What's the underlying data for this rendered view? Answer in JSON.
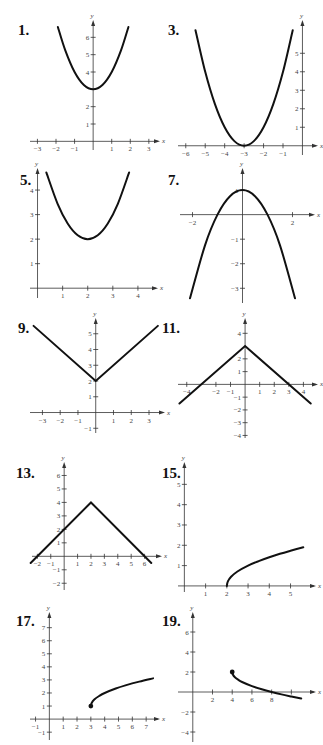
{
  "colors": {
    "curve": "#111111",
    "axis": "#333333",
    "tick_text": "#444444",
    "background": "#ffffff"
  },
  "chart_data": [
    {
      "id": "1",
      "label": "1.",
      "type": "line",
      "curve": "parabola",
      "equation_estimate": "y = x^2 + 3",
      "x_ticks": [
        -3,
        -2,
        -1,
        1,
        2,
        3
      ],
      "y_ticks": [
        1,
        2,
        4,
        5,
        6
      ],
      "xlim": [
        -3.4,
        3.6
      ],
      "ylim": [
        -0.5,
        7
      ],
      "xlabel": "x",
      "ylabel": "y",
      "points": [
        [
          -1.9,
          6.6
        ],
        [
          -1.5,
          5.25
        ],
        [
          -1,
          4
        ],
        [
          -0.5,
          3.25
        ],
        [
          0,
          3
        ],
        [
          0.5,
          3.25
        ],
        [
          1,
          4
        ],
        [
          1.5,
          5.25
        ],
        [
          1.9,
          6.6
        ]
      ],
      "box": {
        "left": 30,
        "top": 20,
        "width": 130,
        "height": 130
      },
      "num_pos": [
        18,
        22
      ]
    },
    {
      "id": "3",
      "label": "3.",
      "type": "line",
      "curve": "parabola",
      "equation_estimate": "y = (x + 3)^2",
      "x_ticks": [
        -6,
        -5,
        -4,
        -3,
        -2,
        -1
      ],
      "y_ticks": [
        1,
        2,
        3,
        4,
        5
      ],
      "xlim": [
        -6.4,
        0.8
      ],
      "ylim": [
        -0.5,
        6.8
      ],
      "xlabel": "x",
      "ylabel": "y",
      "points": [
        [
          -5.5,
          6.25
        ],
        [
          -5,
          4
        ],
        [
          -4.5,
          2.25
        ],
        [
          -4,
          1
        ],
        [
          -3.5,
          0.25
        ],
        [
          -3,
          0
        ],
        [
          -2.5,
          0.25
        ],
        [
          -2,
          1
        ],
        [
          -1.5,
          2.25
        ],
        [
          -1,
          4
        ],
        [
          -0.5,
          6.25
        ]
      ],
      "box": {
        "left": 178,
        "top": 20,
        "width": 140,
        "height": 135
      },
      "num_pos": [
        168,
        22
      ]
    },
    {
      "id": "5",
      "label": "5.",
      "type": "line",
      "curve": "parabola",
      "equation_estimate": "y = (x - 2)^2 + 2",
      "x_ticks": [
        1,
        2,
        3,
        4
      ],
      "y_ticks": [
        1,
        2,
        3,
        4
      ],
      "xlim": [
        -0.3,
        4.8
      ],
      "ylim": [
        -0.4,
        4.9
      ],
      "xlabel": "x",
      "ylabel": "y",
      "points": [
        [
          0.35,
          4.72
        ],
        [
          0.8,
          3.44
        ],
        [
          1.2,
          2.64
        ],
        [
          1.6,
          2.16
        ],
        [
          2,
          2
        ],
        [
          2.4,
          2.16
        ],
        [
          2.8,
          2.64
        ],
        [
          3.2,
          3.44
        ],
        [
          3.65,
          4.72
        ]
      ],
      "box": {
        "left": 30,
        "top": 168,
        "width": 128,
        "height": 130
      },
      "num_pos": [
        20,
        172
      ]
    },
    {
      "id": "7",
      "label": "7.",
      "type": "line",
      "curve": "parabola",
      "equation_estimate": "y = 1 - x^2",
      "x_ticks": [
        -2,
        2
      ],
      "y_ticks": [
        -3,
        -2,
        -1,
        1
      ],
      "xlim": [
        -2.5,
        2.9
      ],
      "ylim": [
        -3.6,
        1.9
      ],
      "xlabel": "x",
      "ylabel": "y",
      "points": [
        [
          -2.1,
          -3.41
        ],
        [
          -1.5,
          -1.25
        ],
        [
          -1,
          0
        ],
        [
          -0.5,
          0.75
        ],
        [
          0,
          1
        ],
        [
          0.5,
          0.75
        ],
        [
          1,
          0
        ],
        [
          1.5,
          -1.25
        ],
        [
          2.1,
          -3.41
        ]
      ],
      "box": {
        "left": 180,
        "top": 168,
        "width": 135,
        "height": 135
      },
      "num_pos": [
        168,
        172
      ]
    },
    {
      "id": "9",
      "label": "9.",
      "type": "line",
      "curve": "absolute-value",
      "equation_estimate": "y = |x| + 2",
      "x_ticks": [
        -3,
        -2,
        -1,
        1,
        2,
        3
      ],
      "y_ticks": [
        -1,
        1,
        2,
        3,
        4,
        5
      ],
      "xlim": [
        -3.7,
        3.9
      ],
      "ylim": [
        -1.3,
        6
      ],
      "xlabel": "x",
      "ylabel": "y",
      "points": [
        [
          -3.5,
          5.5
        ],
        [
          0,
          2
        ],
        [
          3.5,
          5.5
        ]
      ],
      "box": {
        "left": 30,
        "top": 318,
        "width": 135,
        "height": 115
      },
      "num_pos": [
        18,
        320
      ]
    },
    {
      "id": "11",
      "label": "11.",
      "type": "line",
      "curve": "absolute-value",
      "equation_estimate": "y = 3 - |x|",
      "x_ticks": [
        -4,
        -2,
        -1,
        1,
        2,
        3,
        4
      ],
      "y_ticks": [
        -4,
        -3,
        -2,
        -1,
        1,
        2,
        4
      ],
      "xlim": [
        -4.6,
        5.0
      ],
      "ylim": [
        -4.2,
        5.2
      ],
      "xlabel": "x",
      "ylabel": "y",
      "points": [
        [
          -4.5,
          -1.5
        ],
        [
          0,
          3
        ],
        [
          4.5,
          -1.5
        ]
      ],
      "box": {
        "left": 178,
        "top": 318,
        "width": 140,
        "height": 120
      },
      "num_pos": [
        162,
        320
      ]
    },
    {
      "id": "13",
      "label": "13.",
      "type": "line",
      "curve": "absolute-value",
      "equation_estimate": "y = 4 - |x - 2|",
      "x_ticks": [
        -2,
        -1,
        1,
        2,
        3,
        4,
        5,
        6
      ],
      "y_ticks": [
        -2,
        -1,
        1,
        2,
        3,
        4,
        5,
        6
      ],
      "xlim": [
        -2.4,
        7.3
      ],
      "ylim": [
        -2.5,
        7
      ],
      "xlabel": "x",
      "ylabel": "y",
      "points": [
        [
          -2.5,
          -0.5
        ],
        [
          2,
          4
        ],
        [
          6.5,
          -0.5
        ]
      ],
      "box": {
        "left": 32,
        "top": 462,
        "width": 130,
        "height": 128
      },
      "num_pos": [
        16,
        465
      ]
    },
    {
      "id": "15",
      "label": "15.",
      "type": "line",
      "curve": "square-root",
      "equation_estimate": "y = sqrt(x - 2)",
      "x_ticks": [
        1,
        2,
        3,
        4,
        5
      ],
      "y_ticks": [
        1,
        2,
        3,
        4,
        5
      ],
      "xlim": [
        -0.3,
        6.2
      ],
      "ylim": [
        -0.3,
        6.1
      ],
      "xlabel": "x",
      "ylabel": "y",
      "points": [
        [
          2,
          0
        ],
        [
          2.05,
          0.22
        ],
        [
          2.2,
          0.45
        ],
        [
          2.5,
          0.71
        ],
        [
          3,
          1
        ],
        [
          3.5,
          1.22
        ],
        [
          4,
          1.41
        ],
        [
          4.5,
          1.58
        ],
        [
          5,
          1.73
        ],
        [
          5.6,
          1.9
        ]
      ],
      "box": {
        "left": 178,
        "top": 462,
        "width": 138,
        "height": 130
      },
      "num_pos": [
        162,
        465
      ]
    },
    {
      "id": "17",
      "label": "17.",
      "type": "line",
      "curve": "square-root",
      "equation_estimate": "y = sqrt(x - 3) + 1",
      "x_ticks": [
        -1,
        1,
        2,
        3,
        4,
        5,
        6,
        7
      ],
      "y_ticks": [
        -1,
        1,
        2,
        3,
        4,
        5,
        6,
        7
      ],
      "xlim": [
        -1.4,
        8.0
      ],
      "ylim": [
        -1.6,
        8.2
      ],
      "xlabel": "x",
      "ylabel": "y",
      "points": [
        [
          3,
          1
        ],
        [
          3.05,
          1.22
        ],
        [
          3.25,
          1.5
        ],
        [
          3.6,
          1.77
        ],
        [
          4,
          2
        ],
        [
          4.8,
          2.34
        ],
        [
          5.5,
          2.58
        ],
        [
          6.5,
          2.87
        ],
        [
          7.5,
          3.12
        ]
      ],
      "endpoint": [
        3,
        1
      ],
      "box": {
        "left": 30,
        "top": 612,
        "width": 130,
        "height": 128
      },
      "num_pos": [
        16,
        613
      ]
    },
    {
      "id": "19",
      "label": "19.",
      "type": "line",
      "curve": "square-root",
      "equation_estimate": "y = 2 - sqrt(x - 4)",
      "x_ticks": [
        2,
        4,
        6,
        8,
        10
      ],
      "x_tick_labels": [
        "2",
        "4",
        "6",
        "8",
        ""
      ],
      "y_ticks": [
        -4,
        -2,
        2,
        4,
        6
      ],
      "xlim": [
        -1.5,
        12.5
      ],
      "ylim": [
        -5.0,
        8.0
      ],
      "xlabel": "x",
      "ylabel": "y",
      "points": [
        [
          4,
          2
        ],
        [
          4.05,
          1.78
        ],
        [
          4.25,
          1.5
        ],
        [
          4.6,
          1.23
        ],
        [
          5,
          1
        ],
        [
          6,
          0.59
        ],
        [
          7,
          0.27
        ],
        [
          8,
          0
        ],
        [
          9,
          -0.24
        ],
        [
          10,
          -0.45
        ],
        [
          11,
          -0.65
        ]
      ],
      "endpoint": [
        4,
        2
      ],
      "box": {
        "left": 178,
        "top": 612,
        "width": 138,
        "height": 130
      },
      "num_pos": [
        162,
        613
      ]
    }
  ]
}
